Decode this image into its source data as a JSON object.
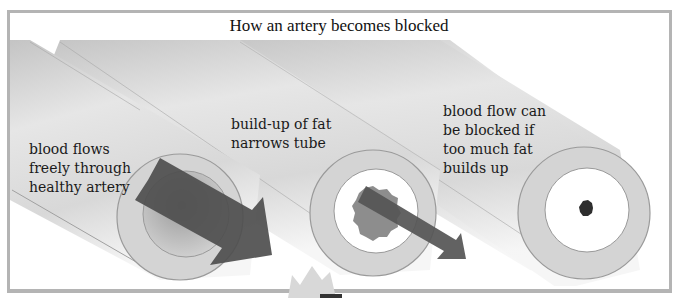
{
  "title": "How an artery becomes blocked",
  "stages": [
    {
      "id": "healthy",
      "label_lines": [
        "blood flows",
        "freely through",
        "healthy artery"
      ]
    },
    {
      "id": "narrowed",
      "label_lines": [
        "build-up of fat",
        "narrows tube"
      ]
    },
    {
      "id": "blocked",
      "label_lines": [
        "blood flow can",
        "be blocked if",
        "too much fat",
        "builds up"
      ]
    }
  ],
  "colors": {
    "frame": "#b4b4b4",
    "tube_light": "#e9e9e9",
    "tube_dark": "#bdbdbd",
    "wall": "#cfcfcf",
    "arrow": "#555555",
    "fat": "#8a8a8a"
  }
}
